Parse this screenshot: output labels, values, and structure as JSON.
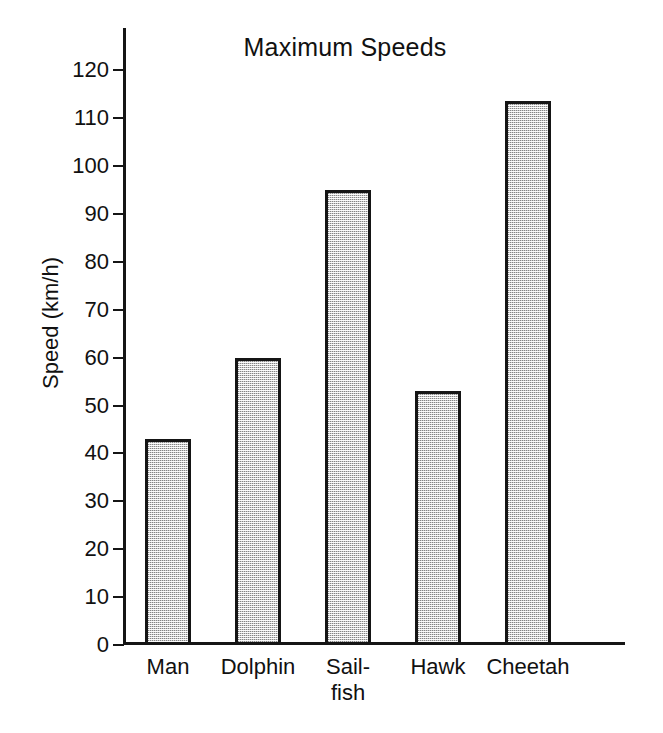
{
  "chart_data": {
    "type": "bar",
    "title": "Maximum Speeds",
    "xlabel": "",
    "ylabel": "Speed (km/h)",
    "categories": [
      "Man",
      "Dolphin",
      "Sail-\nfish",
      "Hawk",
      "Cheetah"
    ],
    "category_labels_flat": [
      "Man",
      "Dolphin",
      "Sail-fish",
      "Hawk",
      "Cheetah"
    ],
    "values": [
      43,
      60,
      95,
      53,
      113.5
    ],
    "ylim": [
      0,
      125
    ],
    "ytick_values": [
      0,
      10,
      20,
      30,
      40,
      50,
      60,
      70,
      80,
      90,
      100,
      110,
      120
    ],
    "ytick_labels": [
      "0",
      "10",
      "20",
      "30",
      "40",
      "50",
      "60",
      "70",
      "80",
      "90",
      "100",
      "110",
      "120"
    ],
    "grid": false,
    "legend": false,
    "bar_fill_color": "#cfcfcf",
    "bar_edge_color": "#151515",
    "axis_color": "#151515",
    "background_color": "#ffffff"
  }
}
